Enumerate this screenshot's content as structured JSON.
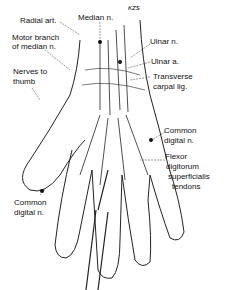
{
  "diagram": {
    "signature": "KZS",
    "labels": {
      "radial_art": "Radial art.",
      "median_n": "Median n.",
      "motor_branch_1": "Motor branch",
      "motor_branch_2": "of median n.",
      "nerves_thumb_1": "Nerves to",
      "nerves_thumb_2": "thumb",
      "ulnar_n": "Ulnar n.",
      "ulnar_a": "Ulnar a.",
      "transverse_1": "Transverse",
      "transverse_2": "carpal lig.",
      "common_digital_right_1": "Common",
      "common_digital_right_2": "digital n.",
      "flexor_1": "Flexor",
      "flexor_2": "digitorum",
      "flexor_3": "superficialis",
      "flexor_4": "tendons",
      "common_digital_left_1": "Common",
      "common_digital_left_2": "digital n."
    }
  }
}
